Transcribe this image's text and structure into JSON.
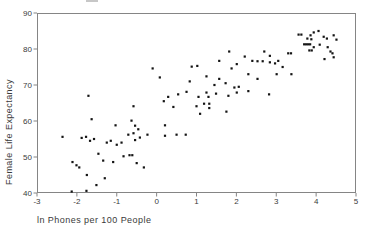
{
  "window": {
    "width": 366,
    "height": 232,
    "background": "#ffffff"
  },
  "chart_data": {
    "type": "scatter",
    "title": "",
    "xlabel": "ln Phones per 100 People",
    "ylabel": "Female Life Expectancy",
    "xlim": [
      -3,
      5
    ],
    "ylim": [
      40,
      90
    ],
    "x_ticks": [
      -3,
      -2,
      -1,
      0,
      1,
      2,
      3,
      4,
      5
    ],
    "y_ticks": [
      40,
      50,
      60,
      70,
      80,
      90
    ],
    "grid": false,
    "legend": null,
    "frame_color": "#858585",
    "tick_label_color": "#3a3a3a",
    "marker": {
      "shape": "square",
      "size_px": 2.2,
      "color": "#141414"
    },
    "points": [
      [
        3.56,
        84.0
      ],
      [
        3.63,
        84.0
      ],
      [
        3.86,
        83.8
      ],
      [
        3.94,
        84.6
      ],
      [
        4.06,
        85.0
      ],
      [
        3.78,
        82.9
      ],
      [
        3.88,
        82.7
      ],
      [
        4.19,
        83.4
      ],
      [
        4.27,
        82.9
      ],
      [
        4.44,
        83.8
      ],
      [
        4.51,
        82.6
      ],
      [
        3.7,
        81.3
      ],
      [
        3.75,
        81.3
      ],
      [
        3.8,
        81.3
      ],
      [
        3.85,
        81.3
      ],
      [
        3.94,
        80.5
      ],
      [
        4.09,
        81.2
      ],
      [
        3.83,
        79.6
      ],
      [
        3.89,
        79.6
      ],
      [
        4.29,
        80.5
      ],
      [
        4.36,
        79.3
      ],
      [
        4.21,
        77.2
      ],
      [
        4.44,
        77.7
      ],
      [
        4.41,
        78.8
      ],
      [
        1.82,
        79.3
      ],
      [
        2.7,
        79.3
      ],
      [
        3.3,
        78.8
      ],
      [
        3.37,
        78.8
      ],
      [
        2.84,
        78.1
      ],
      [
        2.21,
        77.9
      ],
      [
        1.57,
        76.7
      ],
      [
        2.4,
        76.7
      ],
      [
        2.53,
        76.6
      ],
      [
        2.66,
        76.6
      ],
      [
        2.84,
        76.3
      ],
      [
        2.97,
        76.0
      ],
      [
        3.05,
        76.7
      ],
      [
        3.16,
        75.0
      ],
      [
        1.02,
        75.3
      ],
      [
        0.88,
        75.1
      ],
      [
        -0.1,
        74.6
      ],
      [
        1.88,
        74.6
      ],
      [
        2.01,
        75.8
      ],
      [
        3.01,
        73.0
      ],
      [
        3.38,
        73.0
      ],
      [
        2.53,
        71.7
      ],
      [
        2.82,
        67.4
      ],
      [
        2.3,
        73.0
      ],
      [
        0.08,
        72.1
      ],
      [
        0.83,
        71.0
      ],
      [
        1.25,
        72.4
      ],
      [
        1.57,
        71.7
      ],
      [
        1.45,
        70.0
      ],
      [
        1.73,
        70.5
      ],
      [
        1.95,
        69.3
      ],
      [
        2.06,
        69.5
      ],
      [
        2.3,
        68.3
      ],
      [
        0.75,
        68.1
      ],
      [
        0.54,
        67.4
      ],
      [
        0.29,
        66.7
      ],
      [
        0.18,
        65.5
      ],
      [
        1.05,
        66.7
      ],
      [
        1.25,
        67.9
      ],
      [
        1.3,
        66.7
      ],
      [
        1.49,
        67.6
      ],
      [
        1.8,
        67.0
      ],
      [
        2.01,
        67.9
      ],
      [
        1.0,
        64.1
      ],
      [
        1.19,
        64.8
      ],
      [
        1.32,
        64.8
      ],
      [
        1.32,
        63.6
      ],
      [
        0.42,
        63.9
      ],
      [
        1.09,
        62.0
      ],
      [
        1.75,
        62.6
      ],
      [
        0.21,
        58.8
      ],
      [
        -1.71,
        67.0
      ],
      [
        -1.63,
        60.5
      ],
      [
        -0.58,
        64.1
      ],
      [
        -1.03,
        58.8
      ],
      [
        -0.63,
        60.1
      ],
      [
        -0.54,
        58.7
      ],
      [
        -0.46,
        57.7
      ],
      [
        -2.36,
        55.6
      ],
      [
        -1.88,
        55.3
      ],
      [
        -1.77,
        55.6
      ],
      [
        -1.67,
        54.5
      ],
      [
        -1.57,
        55.0
      ],
      [
        -1.25,
        54.0
      ],
      [
        -1.15,
        54.5
      ],
      [
        -1.0,
        53.4
      ],
      [
        -0.88,
        54.0
      ],
      [
        -0.71,
        56.2
      ],
      [
        -0.58,
        56.6
      ],
      [
        -0.54,
        54.7
      ],
      [
        -0.42,
        55.4
      ],
      [
        -0.23,
        56.2
      ],
      [
        0.21,
        55.9
      ],
      [
        0.5,
        56.2
      ],
      [
        0.73,
        56.2
      ],
      [
        -1.46,
        50.9
      ],
      [
        -1.34,
        49.0
      ],
      [
        -1.09,
        48.6
      ],
      [
        -0.83,
        50.2
      ],
      [
        -0.68,
        50.5
      ],
      [
        -0.61,
        50.5
      ],
      [
        -0.5,
        48.3
      ],
      [
        -0.32,
        47.1
      ],
      [
        -2.11,
        48.6
      ],
      [
        -2.01,
        47.7
      ],
      [
        -1.94,
        47.1
      ],
      [
        -1.75,
        45.0
      ],
      [
        -1.3,
        44.1
      ],
      [
        -1.51,
        42.2
      ],
      [
        -1.76,
        40.6
      ],
      [
        -2.13,
        40.4
      ]
    ],
    "layout": {
      "plot_left": 37,
      "plot_top": 13,
      "plot_right": 356,
      "plot_bottom": 193,
      "tick_len": 3.5
    }
  }
}
